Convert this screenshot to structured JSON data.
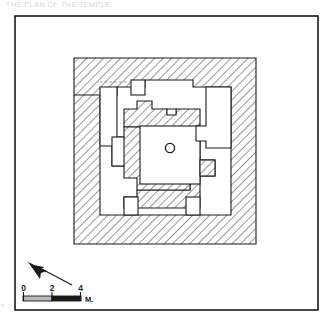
{
  "figure": {
    "kind": "archaeological-floor-plan",
    "caption_faint": "THE PLAN OF THE TEMPLE",
    "corner_mark": "c",
    "ink_color": "#1a1a1a",
    "paper_color": "#ffffff",
    "hatch_color": "#3a3a3a",
    "fill_color": "#ffffff",
    "dashed_note": "restored wall line"
  },
  "frame": {
    "x": 15,
    "y": 16,
    "width": 303,
    "height": 294,
    "stroke_width": 1.6
  },
  "scale_bar": {
    "label_unit": "M.",
    "ticks": [
      "0",
      "2",
      "4"
    ],
    "tick_values": [
      0,
      2,
      4
    ],
    "x": 23,
    "y": 296,
    "length": 58,
    "height": 5
  },
  "north_arrow": {
    "name": "north-arrow",
    "tail_x": 72,
    "tail_y": 285,
    "head_x": 30,
    "head_y": 263
  },
  "plan": {
    "outer_wall": {
      "x": 74,
      "y": 58,
      "width": 182,
      "height": 186
    },
    "center_circle": {
      "cx": 170,
      "cy": 148,
      "r": 4.6
    },
    "walls_path": "M74,58 L256,58 L256,244 L74,244 L74,95 L85,95 L85,215 L245,215 L245,87 L85,87 L85,58 Z",
    "dashed_line": {
      "x": 100,
      "y1": 87,
      "y2": 140
    }
  },
  "legend": {
    "hatch_meaning": "masonry / standing wall",
    "blank_meaning": "open space / room"
  }
}
